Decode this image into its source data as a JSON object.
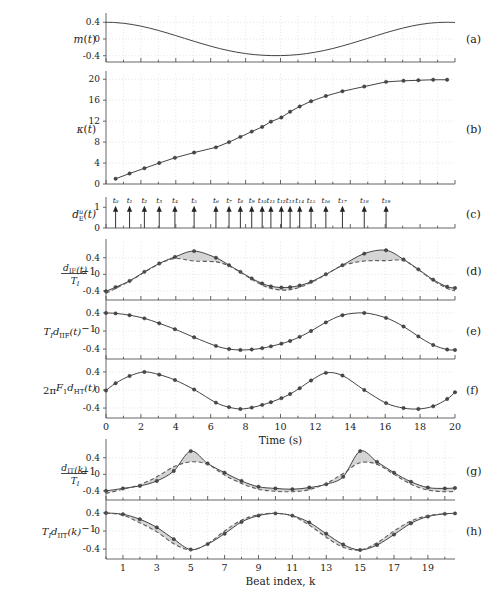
{
  "figure": {
    "width": 501,
    "height": 592,
    "background": "#ffffff",
    "curve_color": "#3a3a3a",
    "dash_color": "#5a5a5a",
    "marker_color": "#4a4a4a",
    "grid_color": "#c8c8c8",
    "axis_color": "#555555",
    "fill_color": "#bcbcbc"
  },
  "panels": [
    {
      "key": "a",
      "letter": "(a)",
      "ylabel": "m(t)",
      "yticks": [
        "0.4",
        "0",
        "-0.4"
      ]
    },
    {
      "key": "b",
      "letter": "(b)",
      "ylabel": "κ(t)",
      "yticks": [
        "20",
        "16",
        "12",
        "8",
        "4",
        "0"
      ]
    },
    {
      "key": "c",
      "letter": "(c)",
      "ylabel": "dᴱ(t)",
      "ylabel_sub": "E",
      "ylabel_sup": "u",
      "yticks": [
        "1",
        "0"
      ]
    },
    {
      "key": "d",
      "letter": "(d)",
      "ylabel": "d_IF(t)/T_I - 1",
      "yticks": [
        "0.4",
        "0",
        "-0.4"
      ]
    },
    {
      "key": "e",
      "letter": "(e)",
      "ylabel": "T_I d_IIF(t) - 1",
      "yticks": [
        "0.4",
        "0",
        "-0.4"
      ]
    },
    {
      "key": "f",
      "letter": "(f)",
      "ylabel": "2πF_1 d_HT(t)",
      "yticks": [
        "0.4",
        "0",
        "-0.4"
      ]
    },
    {
      "key": "g",
      "letter": "(g)",
      "ylabel": "d_IT(k)/T_I - 1",
      "yticks": [
        "0.4",
        "0",
        "-0.4"
      ]
    },
    {
      "key": "h",
      "letter": "(h)",
      "ylabel": "T_I d_IIT(k) - 1",
      "yticks": [
        "0.4",
        "0",
        "-0.4"
      ]
    }
  ],
  "axes": {
    "time_label": "Time (s)",
    "time_ticks": [
      0,
      2,
      4,
      6,
      8,
      10,
      12,
      14,
      16,
      18,
      20
    ],
    "time_range": [
      0,
      20
    ],
    "beat_label": "Beat index, k",
    "beat_ticks": [
      1,
      3,
      5,
      7,
      9,
      11,
      13,
      15,
      17,
      19
    ],
    "beat_range": [
      0,
      20.6
    ]
  },
  "beat_labels": [
    "t₀",
    "t₁",
    "t₂",
    "t₃",
    "t₄",
    "t₅",
    "t₆",
    "t₇",
    "t₈",
    "t₉",
    "t₁₀",
    "t₁₁",
    "t₁₂",
    "t₁₃",
    "t₁₄",
    "t₁₅",
    "t₁₆",
    "t₁₇",
    "t₁₈",
    "t₁₉"
  ],
  "chart_data": [
    {
      "id": "a",
      "type": "line",
      "title": "m(t)",
      "xlabel": "",
      "ylabel": "m(t)",
      "xlim": [
        0,
        20
      ],
      "ylim": [
        -0.55,
        0.55
      ],
      "yticks": [
        0.4,
        0,
        -0.4
      ],
      "grid": true,
      "series": [
        {
          "name": "m(t)",
          "markers": false,
          "x": [
            0,
            0.5,
            1,
            1.5,
            2,
            2.5,
            3,
            3.5,
            4,
            4.5,
            5,
            5.5,
            6,
            6.5,
            7,
            7.5,
            8,
            8.5,
            9,
            9.5,
            10,
            10.5,
            11,
            11.5,
            12,
            12.5,
            13,
            13.5,
            14,
            14.5,
            15,
            15.5,
            16,
            16.5,
            17,
            17.5,
            18,
            18.5,
            19,
            19.5,
            20
          ],
          "y": [
            0.4,
            0.394,
            0.376,
            0.347,
            0.308,
            0.26,
            0.205,
            0.145,
            0.081,
            0.016,
            -0.049,
            -0.112,
            -0.172,
            -0.227,
            -0.275,
            -0.316,
            -0.349,
            -0.373,
            -0.389,
            -0.397,
            -0.397,
            -0.389,
            -0.373,
            -0.349,
            -0.316,
            -0.275,
            -0.227,
            -0.172,
            -0.112,
            -0.049,
            0.016,
            0.081,
            0.145,
            0.205,
            0.26,
            0.308,
            0.347,
            0.376,
            0.394,
            0.4,
            0.395
          ]
        }
      ]
    },
    {
      "id": "b",
      "type": "line",
      "title": "κ(t)",
      "xlabel": "",
      "ylabel": "κ(t)",
      "xlim": [
        0,
        20
      ],
      "ylim": [
        0,
        21
      ],
      "yticks": [
        0,
        4,
        8,
        12,
        16,
        20
      ],
      "grid": true,
      "series": [
        {
          "name": "κ(t)",
          "markers": true,
          "x": [
            0.55,
            1.35,
            2.2,
            3.05,
            3.95,
            5.05,
            6.3,
            7.05,
            7.7,
            8.35,
            8.95,
            9.45,
            10.05,
            10.55,
            11.1,
            11.75,
            12.6,
            13.55,
            14.8,
            16.05,
            17.05,
            17.9,
            18.75,
            19.55
          ],
          "y": [
            1.0,
            2.0,
            3.0,
            4.0,
            5.0,
            6.0,
            7.0,
            8.0,
            9.0,
            10.0,
            10.9,
            11.9,
            12.7,
            13.8,
            14.8,
            15.8,
            16.8,
            17.7,
            18.6,
            19.5,
            19.7,
            19.8,
            19.9,
            19.9
          ]
        }
      ]
    },
    {
      "id": "c",
      "type": "impulse",
      "title": "d_E^u(t)",
      "ylabel": "d_E^u(t)",
      "xlim": [
        0,
        20
      ],
      "ylim": [
        0,
        1.35
      ],
      "yticks": [
        1,
        0
      ],
      "grid": false,
      "impulse_height": 1,
      "beat_times": [
        0.55,
        1.35,
        2.2,
        3.05,
        3.95,
        5.05,
        6.3,
        7.05,
        7.7,
        8.35,
        8.95,
        9.45,
        10.05,
        10.55,
        11.1,
        11.75,
        12.6,
        13.55,
        14.8,
        16.05
      ],
      "beat_labels": [
        "t₀",
        "t₁",
        "t₂",
        "t₃",
        "t₄",
        "t₅",
        "t₆",
        "t₇",
        "t₈",
        "t₉",
        "t₁₀",
        "t₁₁",
        "t₁₂",
        "t₁₃",
        "t₁₄",
        "t₁₅",
        "t₁₆",
        "t₁₇",
        "t₁₈",
        "t₁₉"
      ]
    },
    {
      "id": "d",
      "type": "line",
      "title": "d_IF(t)/T_I - 1",
      "xlabel": "",
      "ylabel": "d_IF(t)/T_I-1",
      "xlim": [
        0,
        20
      ],
      "ylim": [
        -0.62,
        0.78
      ],
      "yticks": [
        0.4,
        0,
        -0.4
      ],
      "grid": true,
      "shaded_between": true,
      "series": [
        {
          "name": "solid",
          "markers": true,
          "style": "solid",
          "x": [
            0,
            0.55,
            1.35,
            2.2,
            3.05,
            3.95,
            5.05,
            6.3,
            7.05,
            7.7,
            8.35,
            8.95,
            9.45,
            10.05,
            10.55,
            11.1,
            11.75,
            12.6,
            13.55,
            14.8,
            16.05,
            17.05,
            17.9,
            18.75,
            19.55,
            20
          ],
          "y": [
            -0.41,
            -0.31,
            -0.16,
            0.06,
            0.26,
            0.42,
            0.56,
            0.4,
            0.22,
            0.06,
            -0.1,
            -0.22,
            -0.29,
            -0.32,
            -0.31,
            -0.27,
            -0.18,
            0.0,
            0.22,
            0.5,
            0.58,
            0.36,
            0.12,
            -0.13,
            -0.3,
            -0.33
          ]
        },
        {
          "name": "dashed",
          "markers": false,
          "style": "dashed",
          "x": [
            0,
            0.55,
            1.35,
            2.2,
            3.05,
            3.95,
            5.05,
            6.3,
            7.05,
            7.7,
            8.35,
            8.95,
            9.45,
            10.05,
            10.55,
            11.1,
            11.75,
            12.6,
            13.55,
            14.8,
            16.05,
            17.05,
            17.9,
            18.75,
            19.55,
            20
          ],
          "y": [
            -0.46,
            -0.34,
            -0.17,
            0.05,
            0.25,
            0.38,
            0.32,
            0.3,
            0.2,
            0.05,
            -0.12,
            -0.26,
            -0.34,
            -0.38,
            -0.37,
            -0.31,
            -0.2,
            -0.01,
            0.21,
            0.32,
            0.33,
            0.33,
            0.11,
            -0.15,
            -0.34,
            -0.4
          ]
        }
      ]
    },
    {
      "id": "e",
      "type": "line",
      "title": "T_I d_IIF(t) - 1",
      "xlabel": "",
      "ylabel": "T_I d_IIF(t)-1",
      "xlim": [
        0,
        20
      ],
      "ylim": [
        -0.62,
        0.62
      ],
      "yticks": [
        0.4,
        0,
        -0.4
      ],
      "grid": true,
      "series": [
        {
          "name": "solid",
          "markers": true,
          "style": "solid",
          "x": [
            0,
            0.55,
            1.35,
            2.2,
            3.05,
            3.95,
            5.05,
            6.3,
            7.05,
            7.7,
            8.35,
            8.95,
            9.45,
            10.05,
            10.55,
            11.1,
            11.75,
            12.6,
            13.55,
            14.8,
            16.05,
            17.05,
            17.9,
            18.75,
            19.55,
            20
          ],
          "y": [
            0.4,
            0.39,
            0.35,
            0.28,
            0.17,
            0.04,
            -0.14,
            -0.33,
            -0.4,
            -0.42,
            -0.41,
            -0.38,
            -0.34,
            -0.28,
            -0.22,
            -0.13,
            0.0,
            0.19,
            0.35,
            0.4,
            0.29,
            0.1,
            -0.12,
            -0.31,
            -0.41,
            -0.42
          ]
        }
      ]
    },
    {
      "id": "f",
      "type": "line",
      "title": "2πF_1 d_HT(t)",
      "xlabel": "Time (s)",
      "ylabel": "2πF_1 d_HT(t)",
      "xlim": [
        0,
        20
      ],
      "ylim": [
        -0.62,
        0.62
      ],
      "yticks": [
        0.4,
        0,
        -0.4
      ],
      "grid": true,
      "series": [
        {
          "name": "solid",
          "markers": true,
          "style": "solid",
          "x": [
            0,
            0.55,
            1.35,
            2.2,
            3.05,
            3.95,
            5.05,
            6.3,
            7.05,
            7.7,
            8.35,
            8.95,
            9.45,
            10.05,
            10.55,
            11.1,
            11.75,
            12.6,
            13.55,
            14.8,
            16.05,
            17.05,
            17.9,
            18.75,
            19.55,
            20
          ],
          "y": [
            -0.01,
            0.15,
            0.31,
            0.4,
            0.34,
            0.22,
            0.01,
            -0.28,
            -0.38,
            -0.42,
            -0.39,
            -0.33,
            -0.27,
            -0.18,
            -0.09,
            0.04,
            0.21,
            0.38,
            0.32,
            0.0,
            -0.29,
            -0.4,
            -0.42,
            -0.36,
            -0.2,
            -0.05
          ]
        }
      ]
    },
    {
      "id": "g",
      "type": "line",
      "title": "d_IT(k)/T_I - 1",
      "xlabel": "",
      "ylabel": "d_IT(k)/T_I-1",
      "xlim": [
        0,
        20.6
      ],
      "ylim": [
        -0.62,
        0.78
      ],
      "yticks": [
        0.4,
        0,
        -0.4
      ],
      "grid": true,
      "shaded_between": true,
      "series": [
        {
          "name": "solid",
          "markers": true,
          "style": "solid",
          "x": [
            0,
            1,
            2,
            3,
            4,
            5,
            6,
            7,
            8,
            9,
            10,
            11,
            12,
            13,
            14,
            15,
            16,
            17,
            18,
            19,
            20,
            20.6
          ],
          "y": [
            -0.4,
            -0.34,
            -0.28,
            -0.16,
            0.08,
            0.56,
            0.26,
            0.04,
            -0.16,
            -0.3,
            -0.34,
            -0.36,
            -0.32,
            -0.24,
            -0.06,
            0.56,
            0.3,
            0.04,
            -0.18,
            -0.32,
            -0.34,
            -0.33
          ]
        },
        {
          "name": "dashed",
          "markers": false,
          "style": "dashed",
          "x": [
            0,
            1,
            2,
            3,
            4,
            5,
            6,
            7,
            8,
            9,
            10,
            11,
            12,
            13,
            14,
            15,
            16,
            17,
            18,
            19,
            20,
            20.6
          ],
          "y": [
            -0.46,
            -0.36,
            -0.25,
            -0.06,
            0.18,
            0.3,
            0.24,
            -0.02,
            -0.22,
            -0.36,
            -0.41,
            -0.42,
            -0.37,
            -0.22,
            0.02,
            0.28,
            0.24,
            0.0,
            -0.24,
            -0.38,
            -0.42,
            -0.41
          ]
        }
      ]
    },
    {
      "id": "h",
      "type": "line",
      "title": "T_I d_IIT(k) - 1",
      "xlabel": "Beat index, k",
      "ylabel": "T_I d_IIT(k)-1",
      "xlim": [
        0,
        20.6
      ],
      "ylim": [
        -0.62,
        0.62
      ],
      "yticks": [
        0.4,
        0,
        -0.4
      ],
      "shaded_between": true,
      "grid": true,
      "series": [
        {
          "name": "solid",
          "markers": true,
          "style": "solid",
          "x": [
            0,
            1,
            2,
            3,
            4,
            5,
            6,
            7,
            8,
            9,
            10,
            11,
            12,
            13,
            14,
            15,
            16,
            17,
            18,
            19,
            20,
            20.6
          ],
          "y": [
            0.4,
            0.37,
            0.26,
            0.08,
            -0.18,
            -0.41,
            -0.29,
            -0.06,
            0.2,
            0.34,
            0.39,
            0.34,
            0.19,
            -0.06,
            -0.3,
            -0.42,
            -0.31,
            -0.08,
            0.17,
            0.32,
            0.38,
            0.39
          ]
        },
        {
          "name": "dashed",
          "markers": false,
          "style": "dashed",
          "x": [
            0,
            1,
            2,
            3,
            4,
            5,
            6,
            7,
            8,
            9,
            10,
            11,
            12,
            13,
            14,
            15,
            16,
            17,
            18,
            19,
            20,
            20.6
          ],
          "y": [
            0.4,
            0.35,
            0.18,
            -0.02,
            -0.28,
            -0.42,
            -0.28,
            0.0,
            0.24,
            0.36,
            0.39,
            0.33,
            0.13,
            -0.14,
            -0.36,
            -0.42,
            -0.26,
            0.0,
            0.22,
            0.34,
            0.38,
            0.39
          ]
        }
      ]
    }
  ]
}
